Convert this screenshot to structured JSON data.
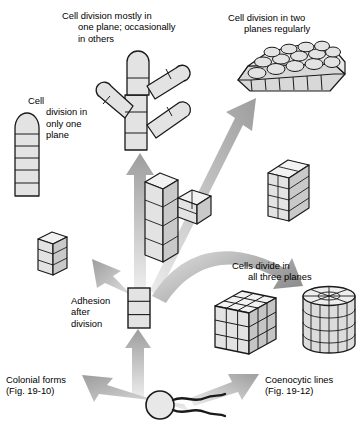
{
  "figure": {
    "background_color": "#ffffff",
    "line_color": "#1a1a1a",
    "cell_fill_color": "#e3e3e3",
    "cell_fill_shadow": "#c9c9c9",
    "arrow_color_dark": "#9a9a9a",
    "arrow_color_light": "#e8e8e8"
  },
  "labels": {
    "a": {
      "tag": "(a)",
      "lines": [
        "Cell",
        "division in",
        "only one",
        "plane"
      ],
      "text": "(a) Cell division in only one plane"
    },
    "b": {
      "tag": "(b)",
      "lines": [
        "Cell division mostly in",
        "one plane; occasionally",
        "in others"
      ],
      "text": "(b) Cell division mostly in one plane; occasionally in others"
    },
    "c": {
      "tag": "(c)",
      "lines": [
        "Cell division in two",
        "planes regularly"
      ],
      "text": "(c) Cell division in two planes regularly"
    },
    "d": {
      "tag": "(d)",
      "lines": [
        "Cells divide in",
        "all three planes"
      ],
      "text": "(d) Cells divide in all three planes"
    },
    "adhesion": {
      "lines": [
        "Adhesion",
        "after",
        "division"
      ],
      "text": "Adhesion after division"
    },
    "colonial": {
      "lines": [
        "Colonial forms",
        "(Fig. 19-10)"
      ],
      "text": "Colonial forms (Fig. 19-10)",
      "figure_ref": "Fig. 19-10"
    },
    "coenocytic": {
      "lines": [
        "Coenocytic lines",
        "(Fig. 19-12)"
      ],
      "text": "Coenocytic lines (Fig. 19-12)",
      "figure_ref": "Fig. 19-12"
    }
  },
  "structures": [
    {
      "id": "flagellated-cell",
      "name": "flagellated unicellular ancestor",
      "description": "Round cell body with two wavy flagella trailing to the right",
      "flagella_count": 2
    },
    {
      "id": "adhesion-stack",
      "name": "adhesion after division",
      "description": "Flat rectangle divided into three stacked cells",
      "cells": 3
    },
    {
      "id": "small-cube-stack-left",
      "name": "three-cell cube stack",
      "description": "Small 3D block of three stacked cubic cells",
      "cells": 3
    },
    {
      "id": "filament",
      "name": "unbranched filament",
      "description": "Rounded-tip capsule divided into six transverse cells",
      "cells": 6
    },
    {
      "id": "branching-cubes",
      "name": "branching cuboid aggregate",
      "description": "Column of cubic cells with a lateral branch of two cells"
    },
    {
      "id": "branched-filament",
      "name": "branched filament",
      "description": "Main trunk of segmented cells with four rounded-tip branches",
      "branches": 4
    },
    {
      "id": "slab",
      "name": "two-plane cell slab",
      "description": "Flat plate two cells wide and four cells tall, one cell deep"
    },
    {
      "id": "cell-sheet",
      "name": "parenchymatous cell sheet",
      "description": "Irregular sheet of rounded cells, two layers thick, in perspective"
    },
    {
      "id": "big-cube",
      "name": "three-dimensional cell mass",
      "description": "Cube of cells three across in all three dimensions"
    },
    {
      "id": "cylinder",
      "name": "cylindrical cell mass",
      "description": "Upright cylinder divided by vertical and horizontal walls with radial top"
    }
  ],
  "arrows": [
    {
      "id": "arrow-origin-to-adhesion",
      "from": "flagellated-cell",
      "to": "adhesion-stack",
      "direction": "up"
    },
    {
      "id": "arrow-origin-to-colonial",
      "from": "flagellated-cell",
      "to": "colonial-forms-label",
      "direction": "up-left"
    },
    {
      "id": "arrow-origin-to-coenocytic",
      "from": "flagellated-cell",
      "to": "coenocytic-lines-label",
      "direction": "down-right"
    },
    {
      "id": "arrow-hub-to-filament",
      "from": "adhesion-stack",
      "to": "filament",
      "direction": "up-left"
    },
    {
      "id": "arrow-hub-to-branched-filament",
      "from": "adhesion-stack",
      "to": "branched-filament",
      "direction": "up"
    },
    {
      "id": "arrow-hub-to-sheet",
      "from": "adhesion-stack",
      "to": "cell-sheet",
      "direction": "up-right"
    },
    {
      "id": "arrow-hub-to-cube",
      "from": "adhesion-stack",
      "to": "cylinder",
      "direction": "curved-right"
    }
  ]
}
